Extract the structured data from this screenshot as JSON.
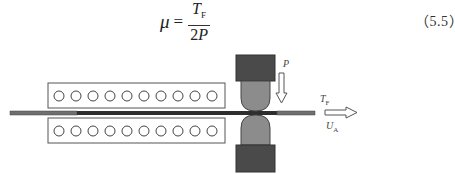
{
  "equation": {
    "lhs": "μ",
    "equals": "=",
    "numerator": "T",
    "numerator_subscript": "F",
    "denominator_coef": "2",
    "denominator_var": "P",
    "number": "（5.5）"
  },
  "diagram": {
    "furnace_circles_per_row": 10,
    "labels": {
      "force": "P",
      "tension": "T",
      "tension_subscript": "F",
      "velocity": "U",
      "velocity_subscript": "A"
    },
    "colors": {
      "strip_light": "#6f6f6f",
      "strip_dark": "#2e2e2e",
      "roll_chock": "#4a4a4a",
      "work_roll": "#8c8c8c",
      "furnace_border": "#555555"
    }
  }
}
